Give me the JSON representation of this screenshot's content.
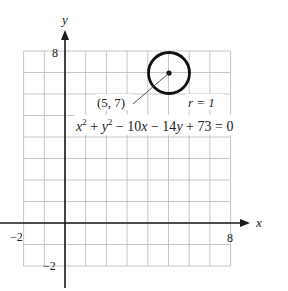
{
  "chart_data": {
    "type": "scatter",
    "title": "",
    "xlabel": "x",
    "ylabel": "y",
    "xlim": [
      -2,
      8
    ],
    "ylim": [
      -2,
      8
    ],
    "grid": true,
    "x_tick_labels": [
      "-2",
      "8"
    ],
    "y_tick_labels": [
      "8",
      "-2"
    ],
    "shapes": [
      {
        "kind": "circle",
        "center": [
          5,
          7
        ],
        "radius": 1
      }
    ],
    "points": [
      {
        "x": 5,
        "y": 7,
        "label": "(5, 7)"
      }
    ],
    "annotations": [
      {
        "text": "(5, 7)",
        "anchor": [
          5,
          7
        ]
      },
      {
        "text": "r = 1"
      },
      {
        "text": "x² + y² − 10x − 14y + 73 = 0"
      }
    ]
  },
  "labels": {
    "x_axis": "x",
    "y_axis": "y",
    "x_min": "−2",
    "x_max": "8",
    "y_max": "8",
    "y_min": "−2",
    "center_point": "(5, 7)",
    "radius": "r = 1",
    "eq_x": "x",
    "eq_sup1": "2",
    "eq_plus1": " + ",
    "eq_y": "y",
    "eq_sup2": "2",
    "eq_rest1": " − 10",
    "eq_x2": "x",
    "eq_rest2": " − 14",
    "eq_y2": "y",
    "eq_rest3": " + 73 = 0"
  },
  "colors": {
    "grid": "#b8b8b8",
    "axis": "#1a1a1a",
    "circle": "#111111",
    "leader": "#555555"
  }
}
